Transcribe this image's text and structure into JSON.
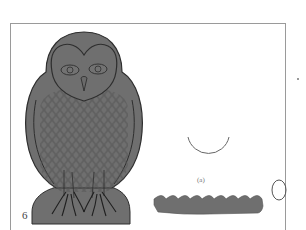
{
  "figure": {
    "number_label": "6",
    "caption_label": "(a)",
    "colors": {
      "fill": "#6f6f6f",
      "outline": "#2e2e2e",
      "feather_line": "#555555",
      "frame": "#9a9a9a",
      "arc": "#666666"
    },
    "elements": [
      {
        "name": "owl-figure",
        "description": "grey owl silhouette with heart-shaped face, eyes, beak, scalloped feather pattern, talons on rounded base"
      },
      {
        "name": "arc-shape",
        "description": "semicircular U-shaped arc outline"
      },
      {
        "name": "scalloped-band",
        "description": "grey horizontal band with scalloped top edge"
      },
      {
        "name": "egg-shape",
        "description": "small oval/egg outline"
      }
    ]
  }
}
